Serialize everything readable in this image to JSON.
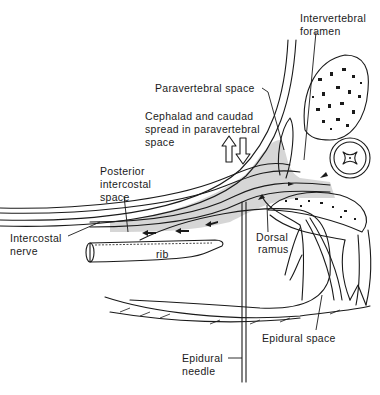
{
  "figure": {
    "type": "anatomical-diagram"
  },
  "labels": {
    "intervertebral_foramen": [
      "Intervertebral",
      "foramen"
    ],
    "paravertebral_space": "Paravertebral space",
    "cephalad_caudad": [
      "Cephalad and caudad",
      "spread in paravertebral",
      "space"
    ],
    "posterior_intercostal": [
      "Posterior",
      "intercostal",
      "space"
    ],
    "intercostal_nerve": [
      "Intercostal",
      "nerve"
    ],
    "rib": "rib",
    "dorsal_ramus": [
      "Dorsal",
      "ramus"
    ],
    "epidural_space": "Epidural space",
    "epidural_needle": [
      "Epidural",
      "needle"
    ]
  },
  "colors": {
    "ink": "#1a1a1a",
    "shading": "#cfcfcf",
    "background": "#ffffff"
  }
}
